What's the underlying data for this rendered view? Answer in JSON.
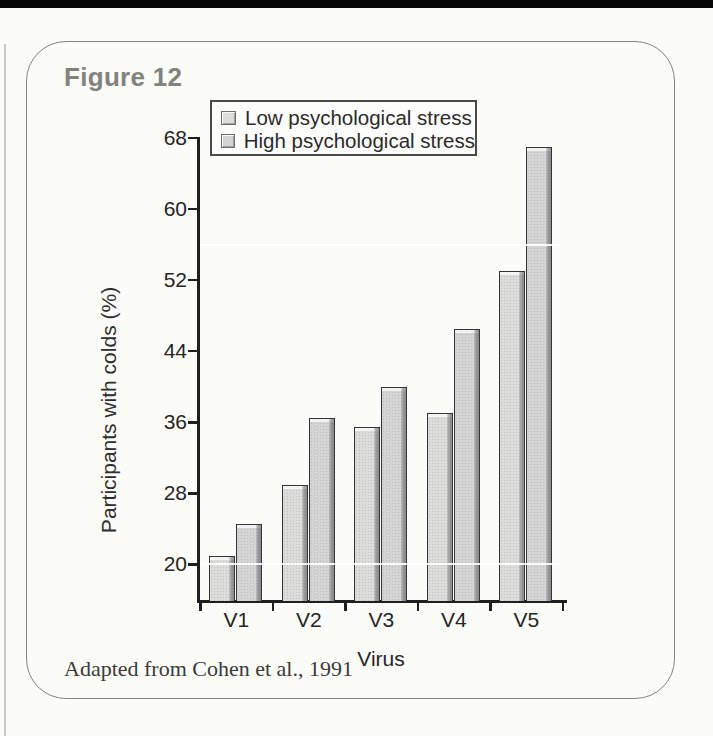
{
  "page": {
    "figure_label": "Figure 12",
    "caption": "Adapted from Cohen et al., 1991"
  },
  "chart_data": {
    "type": "bar",
    "title": "Figure 12",
    "categories": [
      "V1",
      "V2",
      "V3",
      "V4",
      "V5"
    ],
    "series": [
      {
        "name": "Low psychological stress",
        "color": "#dcdcda",
        "values": [
          21,
          29,
          35.5,
          37,
          53
        ]
      },
      {
        "name": "High psychological stress",
        "color": "#d4d4d4",
        "values": [
          24.5,
          36.5,
          40,
          46.5,
          67
        ]
      }
    ],
    "xlabel": "Virus",
    "ylabel": "Participants with colds (%)",
    "y_ticks": [
      20,
      28,
      36,
      44,
      52,
      60,
      68
    ],
    "ylim": [
      16,
      68
    ],
    "white_gridlines": [
      20,
      56
    ],
    "grid": "white lines over bars only",
    "legend_position": "top-left",
    "colors": {
      "axis": "#1f1f1f",
      "figure_label": "#82827e",
      "text": "#262626",
      "bar_outline": "#343434",
      "bar_shadow": "#8f8f95",
      "bar_bevel": "#eeeeee",
      "page_top_bar": "#070707"
    }
  }
}
